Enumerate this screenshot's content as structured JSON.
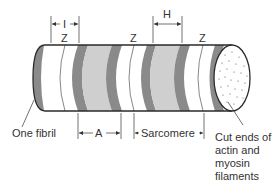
{
  "figure": {
    "colors": {
      "outline": "#2a2a2a",
      "dark_band": "#8a8a8a",
      "a_band_fill": "#cfcfcf",
      "light_band": "#ffffff",
      "text": "#333333"
    }
  },
  "labels": {
    "z_top_1": "Z",
    "z_top_2": "Z",
    "z_top_3": "Z",
    "i_band": "I",
    "h_zone": "H",
    "a_band": "A",
    "sarcomere": "Sarcomere",
    "one_fibril": "One fibril",
    "cut_ends_line1": "Cut ends of",
    "cut_ends_line2": "actin and",
    "cut_ends_line3": "myosin",
    "cut_ends_line4": "filaments"
  }
}
